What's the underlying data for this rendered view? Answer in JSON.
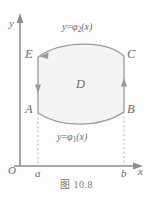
{
  "figure": {
    "caption": "图 10.8",
    "region_label": "D",
    "axes": {
      "x_label": "x",
      "y_label": "y",
      "origin_label": "O",
      "x_ticks": [
        {
          "label": "a",
          "x": 0.27
        },
        {
          "label": "b",
          "x": 0.84
        }
      ]
    },
    "points": [
      {
        "name": "A",
        "label": "A",
        "position": "lower-left"
      },
      {
        "name": "B",
        "label": "B",
        "position": "lower-right"
      },
      {
        "name": "C",
        "label": "C",
        "position": "upper-right"
      },
      {
        "name": "E",
        "label": "E",
        "position": "upper-left"
      }
    ],
    "curves": [
      {
        "name": "upper-boundary",
        "label_lhs": "y",
        "label_eq": "=",
        "label_fn": "φ",
        "label_sub": "2",
        "label_arg": "(x)",
        "label_full": "y=φ₂(x)",
        "direction": "right-to-left"
      },
      {
        "name": "lower-boundary",
        "label_lhs": "y",
        "label_eq": "=",
        "label_fn": "φ",
        "label_sub": "1",
        "label_arg": "(x)",
        "label_full": "y=φ₁(x)",
        "direction": "left-to-right"
      }
    ],
    "edges": [
      {
        "name": "left-edge-EA",
        "from": "E",
        "to": "A",
        "arrow": "down"
      },
      {
        "name": "right-edge-BC",
        "from": "B",
        "to": "C",
        "arrow": "up"
      }
    ],
    "colors": {
      "stroke": "#8d8d8d",
      "fill": "#f4f4f4",
      "text": "#6a6a6a",
      "dashed": "#b6b6b6",
      "background": "#fdfdfd"
    }
  }
}
